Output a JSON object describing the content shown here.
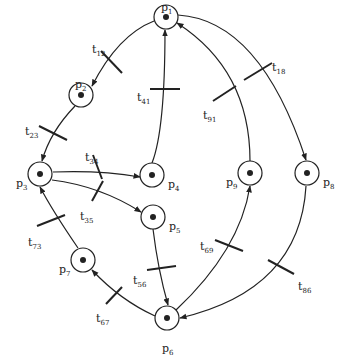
{
  "diagram": {
    "type": "petri-net",
    "places": [
      {
        "id": "p1",
        "label": "p",
        "sub": "1",
        "x": 166,
        "y": 17,
        "lx": 161,
        "ly": 2,
        "tokens": 1
      },
      {
        "id": "p2",
        "label": "p",
        "sub": "2",
        "x": 81,
        "y": 95,
        "lx": 75,
        "ly": 79,
        "tokens": 1
      },
      {
        "id": "p3",
        "label": "p",
        "sub": "3",
        "x": 40,
        "y": 174,
        "lx": 16,
        "ly": 178,
        "tokens": 1
      },
      {
        "id": "p4",
        "label": "p",
        "sub": "4",
        "x": 152,
        "y": 175,
        "lx": 168,
        "ly": 179,
        "tokens": 1
      },
      {
        "id": "p5",
        "label": "p",
        "sub": "5",
        "x": 153,
        "y": 217,
        "lx": 169,
        "ly": 221,
        "tokens": 1
      },
      {
        "id": "p6",
        "label": "p",
        "sub": "6",
        "x": 167,
        "y": 318,
        "lx": 162,
        "ly": 343,
        "tokens": 1
      },
      {
        "id": "p7",
        "label": "p",
        "sub": "7",
        "x": 83,
        "y": 260,
        "lx": 59,
        "ly": 264,
        "tokens": 1
      },
      {
        "id": "p8",
        "label": "p",
        "sub": "8",
        "x": 307,
        "y": 173,
        "lx": 323,
        "ly": 177,
        "tokens": 1
      },
      {
        "id": "p9",
        "label": "p",
        "sub": "9",
        "x": 250,
        "y": 173,
        "lx": 226,
        "ly": 177,
        "tokens": 1
      }
    ],
    "transitions": [
      {
        "id": "t12",
        "label": "t",
        "sub": "12",
        "lx": 92,
        "ly": 44
      },
      {
        "id": "t23",
        "label": "t",
        "sub": "23",
        "lx": 25,
        "ly": 126
      },
      {
        "id": "t34",
        "label": "t",
        "sub": "34",
        "lx": 85,
        "ly": 152
      },
      {
        "id": "t35",
        "label": "t",
        "sub": "35",
        "lx": 80,
        "ly": 211
      },
      {
        "id": "t41",
        "label": "t",
        "sub": "41",
        "lx": 137,
        "ly": 92
      },
      {
        "id": "t18",
        "label": "t",
        "sub": "18",
        "lx": 272,
        "ly": 62
      },
      {
        "id": "t91",
        "label": "t",
        "sub": "91",
        "lx": 203,
        "ly": 110
      },
      {
        "id": "t73",
        "label": "t",
        "sub": "73",
        "lx": 28,
        "ly": 237
      },
      {
        "id": "t56",
        "label": "t",
        "sub": "56",
        "lx": 133,
        "ly": 275
      },
      {
        "id": "t69",
        "label": "t",
        "sub": "69",
        "lx": 200,
        "ly": 241
      },
      {
        "id": "t86",
        "label": "t",
        "sub": "86",
        "lx": 298,
        "ly": 281
      },
      {
        "id": "t67",
        "label": "t",
        "sub": "67",
        "lx": 96,
        "ly": 313
      }
    ],
    "colors": {
      "stroke": "#222222",
      "background": "#ffffff"
    }
  }
}
